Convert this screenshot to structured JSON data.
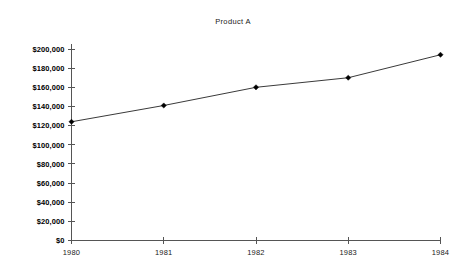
{
  "chart_data": {
    "type": "line",
    "title": "Product A",
    "xlabel": "",
    "ylabel": "",
    "categories": [
      "1980",
      "1981",
      "1982",
      "1983",
      "1984"
    ],
    "x": [
      1980,
      1981,
      1982,
      1983,
      1984
    ],
    "values": [
      124000,
      141000,
      160000,
      170000,
      194000
    ],
    "series": [
      {
        "name": "Product A",
        "values": [
          124000,
          141000,
          160000,
          170000,
          194000
        ]
      }
    ],
    "ylim": [
      0,
      200000
    ],
    "xlim": [
      1980,
      1984
    ],
    "ytick_values": [
      0,
      20000,
      40000,
      60000,
      80000,
      100000,
      120000,
      140000,
      160000,
      180000,
      200000
    ],
    "ytick_labels": [
      "$0",
      "$20,000",
      "$40,000",
      "$60,000",
      "$80,000",
      "$100,000",
      "$120,000",
      "$140,000",
      "$160,000",
      "$180,000",
      "$200,000"
    ],
    "xtick_labels": [
      "1980",
      "1981",
      "1982",
      "1983",
      "1984"
    ],
    "grid": false,
    "legend": false,
    "legend_position": "none",
    "marker": "diamond",
    "line_color": "#3a3a3a",
    "marker_color": "#000000",
    "axis_color": "#555555",
    "background_color": "#ffffff",
    "annotations": []
  }
}
